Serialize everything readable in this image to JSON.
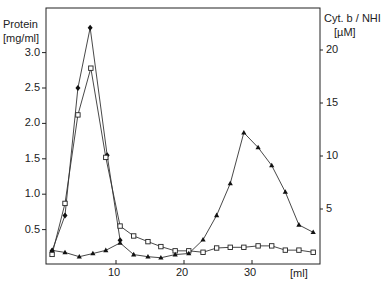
{
  "chart_data": {
    "type": "line",
    "title": "",
    "xlabel": "[ml]",
    "ylabel_left": "Protein [mg/ml]",
    "ylabel_right": "Cyt. b / NHI [µM]",
    "x_ticks": [
      "10",
      "20",
      "30"
    ],
    "y_left_ticks": [
      "0.5",
      "1.0",
      "1.5",
      "2.0",
      "2.5",
      "3.0"
    ],
    "y_right_ticks": [
      "5",
      "10",
      "15",
      "20"
    ],
    "xlim": [
      0,
      40
    ],
    "ylim_left": [
      0,
      3.4
    ],
    "ylim_right": [
      0,
      22
    ],
    "grid": false,
    "series": [
      {
        "name": "Protein (filled diamonds)",
        "axis": "left",
        "marker": "filled-diamond",
        "x": [
          0.6,
          2.5,
          4.4,
          6.2,
          8.7,
          10.6
        ],
        "y": [
          0.2,
          0.7,
          2.5,
          3.35,
          1.55,
          0.35
        ]
      },
      {
        "name": "Protein (open squares)",
        "axis": "left",
        "marker": "open-square",
        "x": [
          0.6,
          2.5,
          4.4,
          6.3,
          8.5,
          10.6,
          12.6,
          14.7,
          16.6,
          18.7,
          20.7,
          22.8,
          24.8,
          26.8,
          28.8,
          30.9,
          32.9,
          34.9,
          36.9,
          39.0
        ],
        "y": [
          0.15,
          0.87,
          2.12,
          2.78,
          1.52,
          0.55,
          0.41,
          0.33,
          0.26,
          0.2,
          0.2,
          0.18,
          0.24,
          0.25,
          0.25,
          0.27,
          0.27,
          0.21,
          0.21,
          0.18
        ]
      },
      {
        "name": "Cyt. b / NHI (filled triangles)",
        "axis": "right",
        "marker": "filled-triangle",
        "x": [
          0.6,
          2.5,
          4.6,
          6.6,
          8.5,
          10.6,
          12.6,
          14.7,
          16.6,
          18.7,
          20.7,
          22.8,
          24.8,
          26.8,
          28.8,
          30.9,
          32.9,
          34.9,
          36.9,
          39.0
        ],
        "y": [
          1.1,
          0.9,
          0.5,
          0.8,
          1.1,
          1.8,
          0.7,
          0.5,
          0.4,
          0.7,
          0.8,
          2.1,
          4.4,
          7.4,
          12.2,
          10.8,
          9.1,
          6.6,
          3.5,
          2.8
        ]
      }
    ]
  }
}
